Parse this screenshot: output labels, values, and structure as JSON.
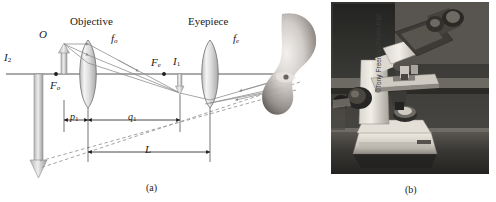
{
  "figure": {
    "panel_a": {
      "caption": "(a)",
      "labels": {
        "objective": "Objective",
        "eyepiece": "Eyepiece",
        "focal_objective": "f",
        "focal_objective_sub": "o",
        "focal_eyepiece": "f",
        "focal_eyepiece_sub": "e",
        "object": "O",
        "image_one": "I",
        "image_one_sub": "1",
        "image_two": "I",
        "image_two_sub": "2",
        "focus_objective_point": "F",
        "focus_objective_point_sub": "o",
        "focus_eyepiece_point": "F",
        "focus_eyepiece_point_sub": "e",
        "distance_p1": "p",
        "distance_p1_sub": "1",
        "distance_q1": "q",
        "distance_q1_sub": "1",
        "tube_length": "L"
      }
    },
    "panel_b": {
      "caption": "(b)",
      "credit": "©Tony Freeman/Photo Edit",
      "photo_subject": "compound-microscope-photograph"
    }
  },
  "colors": {
    "ink": "#1a1a1a",
    "ray": "#7a7a7a",
    "arrow_fill": "#c9c9c9",
    "lens_fill": "#e8e8e8",
    "axis": "#555555",
    "background": "#ffffff",
    "photo_dark": "#2a2a28"
  }
}
